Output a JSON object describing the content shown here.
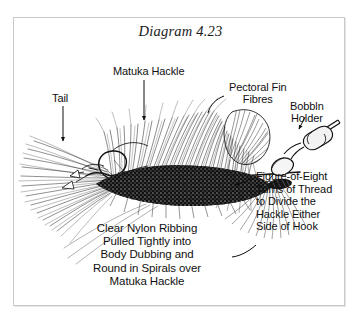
{
  "figure": {
    "title": "Diagram 4.23",
    "background_color": "#ffffff",
    "ink_color": "#101010",
    "frame_color": "#c9c9c9"
  },
  "labels": {
    "tail": "Tail",
    "matuka_hackle": "Matuka Hackle",
    "pectoral_fin_fibres": "Pectoral Fin\nFibres",
    "bobbin_holder": "Bobbln\nHolder",
    "figure_of_eight": "Figure-of-Eight\nTurns of Thread\nto Divide the\nHackle Either\nSide of Hook",
    "ribbing": "Clear Nylon Ribbing\nPulled Tightly into\nBody Dubbing and\nRound in Spirals over\nMatuka Hackle"
  }
}
